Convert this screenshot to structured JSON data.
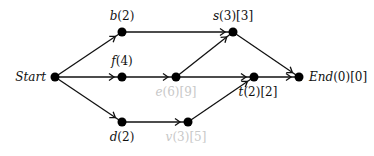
{
  "diagram": {
    "type": "directed-graph",
    "nodes": [
      {
        "id": "start",
        "name": "Start",
        "label": "Start",
        "x": 55,
        "y": 77,
        "lx": 46,
        "ly": 81,
        "anchor": "end",
        "faded": false
      },
      {
        "id": "b",
        "name": "b",
        "label": "b(2)",
        "x": 122,
        "y": 32,
        "lx": 122,
        "ly": 20,
        "anchor": "middle",
        "faded": false
      },
      {
        "id": "f",
        "name": "f",
        "label": "f(4)",
        "x": 122,
        "y": 77,
        "lx": 122,
        "ly": 65,
        "anchor": "middle",
        "faded": false
      },
      {
        "id": "d",
        "name": "d",
        "label": "d(2)",
        "x": 122,
        "y": 122,
        "lx": 122,
        "ly": 141,
        "anchor": "middle",
        "faded": false
      },
      {
        "id": "s",
        "name": "s",
        "label": "s(3)[3]",
        "x": 233,
        "y": 32,
        "lx": 233,
        "ly": 20,
        "anchor": "middle",
        "faded": false
      },
      {
        "id": "e",
        "name": "e",
        "label": "e(6)[9]",
        "x": 176,
        "y": 77,
        "lx": 176,
        "ly": 96,
        "anchor": "middle",
        "faded": true
      },
      {
        "id": "t",
        "name": "t",
        "label": "t(2)[2]",
        "x": 254,
        "y": 77,
        "lx": 258,
        "ly": 96,
        "anchor": "middle",
        "faded": false
      },
      {
        "id": "v",
        "name": "v",
        "label": "v(3)[5]",
        "x": 188,
        "y": 122,
        "lx": 186,
        "ly": 141,
        "anchor": "middle",
        "faded": true
      },
      {
        "id": "end",
        "name": "End",
        "label": "End(0)[0]",
        "x": 299,
        "y": 77,
        "lx": 309,
        "ly": 81,
        "anchor": "start",
        "faded": false
      }
    ],
    "edges": [
      {
        "from": "start",
        "to": "b"
      },
      {
        "from": "start",
        "to": "f"
      },
      {
        "from": "start",
        "to": "d"
      },
      {
        "from": "b",
        "to": "s"
      },
      {
        "from": "f",
        "to": "e"
      },
      {
        "from": "e",
        "to": "s"
      },
      {
        "from": "e",
        "to": "t"
      },
      {
        "from": "d",
        "to": "v"
      },
      {
        "from": "v",
        "to": "t"
      },
      {
        "from": "s",
        "to": "end"
      },
      {
        "from": "t",
        "to": "end"
      }
    ],
    "colors": {
      "edge": "#111111",
      "node": "#000000",
      "label": "#111111",
      "faded_label": "#c8c8c8"
    }
  }
}
